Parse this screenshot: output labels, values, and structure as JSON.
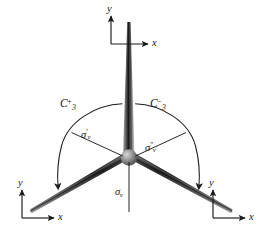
{
  "figure": {
    "background_color": "#ffffff",
    "ink_color": "#1a1a1a",
    "blade_color": "#3a3a3a",
    "hub_color": "#8a8a8a"
  },
  "frames": [
    {
      "id": "top",
      "position": "top-center",
      "y_label": "y",
      "x_label": "x"
    },
    {
      "id": "bottom-left",
      "position": "bottom-left",
      "y_label": "y",
      "x_label": "x"
    },
    {
      "id": "bottom-right",
      "position": "bottom-right",
      "y_label": "y",
      "x_label": "x"
    }
  ],
  "operations": [
    {
      "id": "c3-plus",
      "base": "C",
      "subscript": "3",
      "superscript": "+",
      "description": "counterclockwise three-fold rotation"
    },
    {
      "id": "c3-minus",
      "base": "C",
      "subscript": "3",
      "superscript": "−",
      "description": "clockwise three-fold rotation"
    }
  ],
  "mirrors": [
    {
      "id": "sigma-v-prime",
      "symbol": "σ",
      "superscript": "′",
      "subscript": "v",
      "description": "mirror plane upper-left"
    },
    {
      "id": "sigma-v-double-prime",
      "symbol": "σ",
      "superscript": "″",
      "subscript": "v",
      "description": "mirror plane upper-right"
    },
    {
      "id": "sigma-v",
      "symbol": "σ",
      "superscript": "",
      "subscript": "v",
      "description": "vertical mirror plane bottom"
    }
  ]
}
